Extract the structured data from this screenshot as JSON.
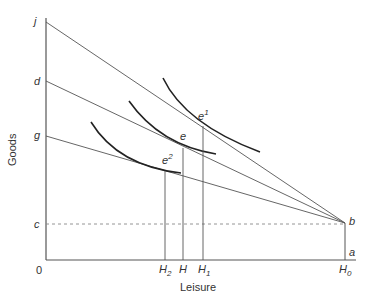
{
  "axes": {
    "x_label": "Leisure",
    "y_label": "Goods",
    "origin_label": "0"
  },
  "y_intercepts": {
    "j": "j",
    "d": "d",
    "g": "g",
    "c": "c"
  },
  "points": {
    "b": "b",
    "a": "a",
    "e": "e",
    "e1_base": "e",
    "e1_sup": "1",
    "e2_base": "e",
    "e2_sup": "2"
  },
  "x_ticks": {
    "H2_base": "H",
    "H2_sub": "2",
    "H": "H",
    "H1_base": "H",
    "H1_sub": "1",
    "H0_base": "H",
    "H0_sub": "0"
  },
  "colors": {
    "line": "#555555",
    "curve": "#222222",
    "dashed": "#888888",
    "text": "#333333"
  }
}
